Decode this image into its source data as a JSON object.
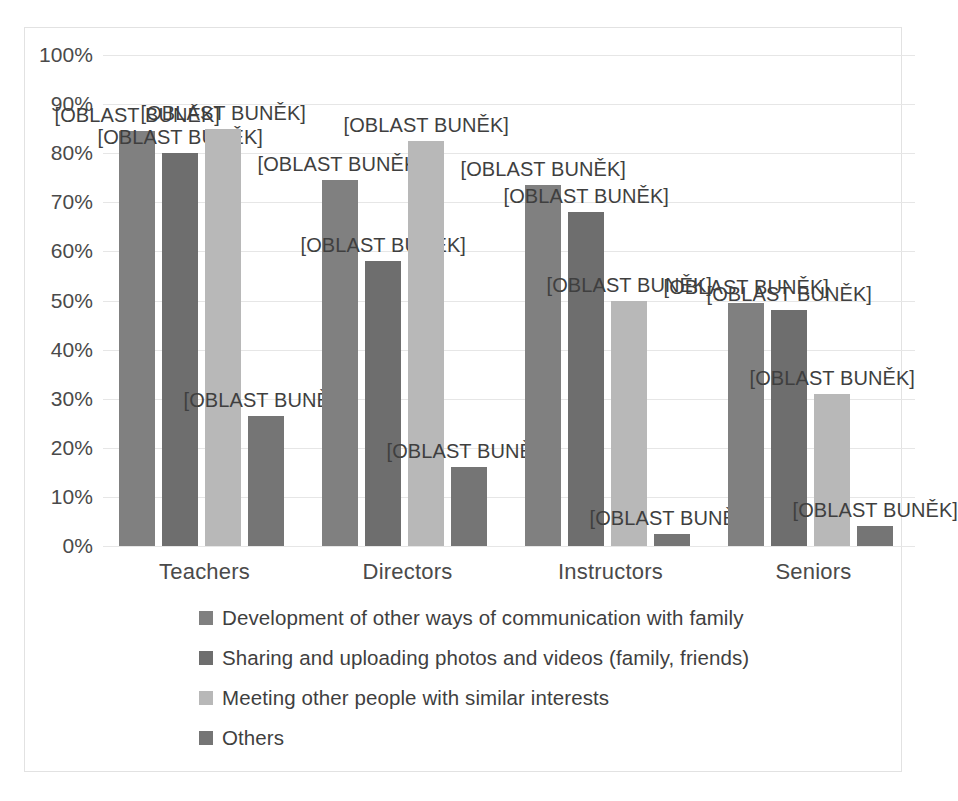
{
  "chart_data": {
    "type": "bar",
    "title": "",
    "subtitle": "",
    "xlabel": "",
    "ylabel": "",
    "ylim": [
      0,
      100
    ],
    "grid": true,
    "legend_position": "bottom",
    "categories": [
      "Teachers",
      "Directors",
      "Instructors",
      "Seniors"
    ],
    "ytick_labels": [
      "100%",
      "90%",
      "80%",
      "70%",
      "60%",
      "50%",
      "40%",
      "30%",
      "20%",
      "10%",
      "0%"
    ],
    "ytick_values": [
      100,
      90,
      80,
      70,
      60,
      50,
      40,
      30,
      20,
      10,
      0
    ],
    "data_label_text": "[OBLAST BUNĚK]",
    "series": [
      {
        "name": "Development of other ways of communication with family",
        "color": "#808080",
        "values": [
          84.5,
          74.5,
          73.5,
          49.5
        ]
      },
      {
        "name": "Sharing and uploading photos and videos (family, friends)",
        "color": "#6e6e6e",
        "values": [
          80.0,
          58.0,
          68.0,
          48.0
        ]
      },
      {
        "name": "Meeting other people with similar interests",
        "color": "#b8b8b8",
        "values": [
          85.0,
          82.5,
          50.0,
          31.0
        ]
      },
      {
        "name": "Others",
        "color": "#757575",
        "values": [
          26.5,
          16.0,
          2.5,
          4.0
        ]
      }
    ],
    "data_labels": [
      [
        "[OBLAST BUNĚK]",
        "[OBLAST BUNĚK]",
        "[OBLAST BUNĚK]",
        "[OBLAST BUNĚK]"
      ],
      [
        "[OBLAST BUNĚK]",
        "[OBLAST BUNĚK]",
        "[OBLAST BUNĚK]",
        "[OBLAST BUNĚK]"
      ],
      [
        "[OBLAST BUNĚK]",
        "[OBLAST BUNĚK]",
        "[OBLAST BUNĚK]",
        "[OBLAST BUNĚK]"
      ],
      [
        "[OBLAST BUNĚK]",
        "[OBLAST BUNĚK]",
        "[OBLAST BUNĚK]",
        "[OBLAST BUNĚK]"
      ]
    ]
  },
  "legend": {
    "items": [
      {
        "label": "Development of other ways of communication with family",
        "color": "#808080"
      },
      {
        "label": "Sharing and uploading photos and videos (family, friends)",
        "color": "#6e6e6e"
      },
      {
        "label": "Meeting other people with similar interests",
        "color": "#b8b8b8"
      },
      {
        "label": "Others",
        "color": "#757575"
      }
    ]
  }
}
